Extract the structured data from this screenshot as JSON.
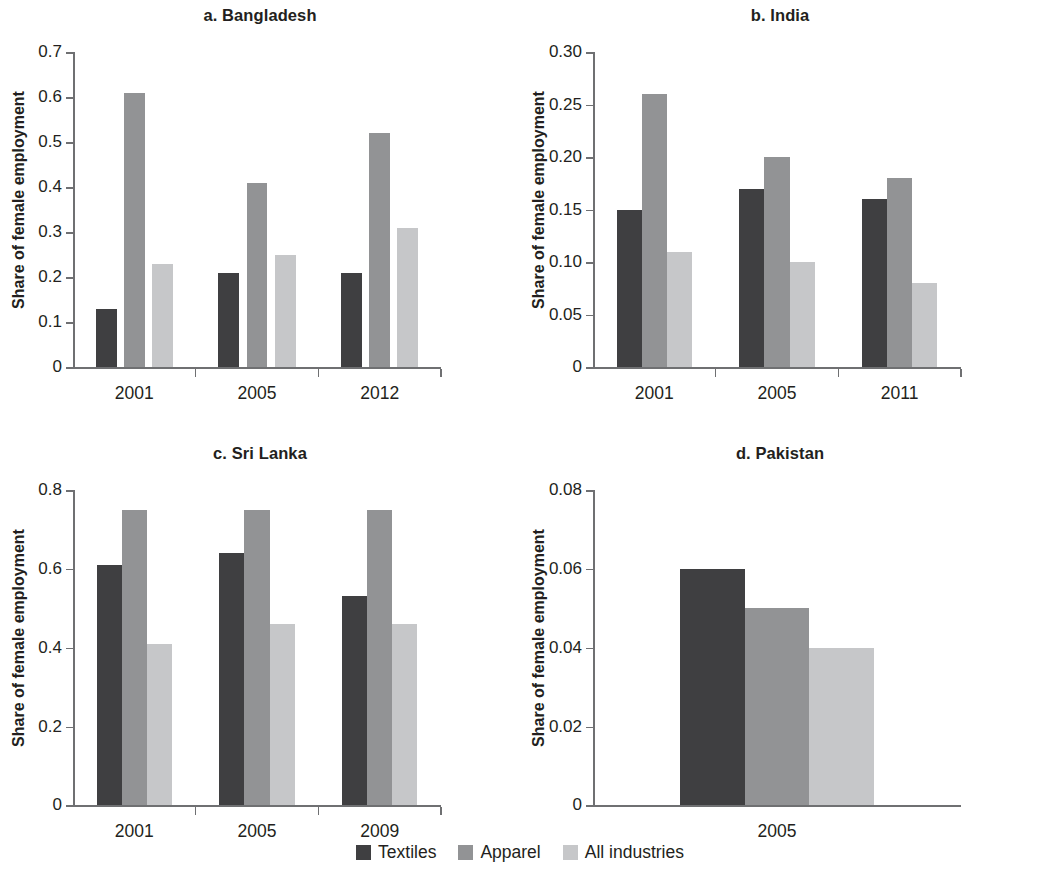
{
  "figure": {
    "ylabel": "Share of female employment"
  },
  "legend": {
    "items": [
      {
        "label": "Textiles",
        "color": "#3f3f41"
      },
      {
        "label": "Apparel",
        "color": "#929395"
      },
      {
        "label": "All industries",
        "color": "#c6c7c9"
      }
    ]
  },
  "chart_data": [
    {
      "type": "bar",
      "panel": "a",
      "title": "a. Bangladesh",
      "xlabel": "",
      "ylabel": "Share of female employment",
      "categories": [
        "2001",
        "2005",
        "2012"
      ],
      "series": [
        {
          "name": "Textiles",
          "color": "#3f3f41",
          "values": [
            0.13,
            0.21,
            0.21
          ]
        },
        {
          "name": "Apparel",
          "color": "#929395",
          "values": [
            0.61,
            0.41,
            0.52
          ]
        },
        {
          "name": "All industries",
          "color": "#c6c7c9",
          "values": [
            0.23,
            0.25,
            0.31
          ]
        }
      ],
      "ylim": [
        0,
        0.7
      ],
      "yticks": [
        0,
        0.1,
        0.2,
        0.3,
        0.4,
        0.5,
        0.6,
        0.7
      ],
      "ytick_labels": [
        "0",
        "0.1",
        "0.2",
        "0.3",
        "0.4",
        "0.5",
        "0.6",
        "0.7"
      ],
      "grid": false,
      "bar_width_frac": 0.17,
      "group_gap_frac": 0.06
    },
    {
      "type": "bar",
      "panel": "b",
      "title": "b. India",
      "xlabel": "",
      "ylabel": "Share of female employment",
      "categories": [
        "2001",
        "2005",
        "2011"
      ],
      "series": [
        {
          "name": "Textiles",
          "color": "#3f3f41",
          "values": [
            0.15,
            0.17,
            0.16
          ]
        },
        {
          "name": "Apparel",
          "color": "#929395",
          "values": [
            0.26,
            0.2,
            0.18
          ]
        },
        {
          "name": "All industries",
          "color": "#c6c7c9",
          "values": [
            0.11,
            0.1,
            0.08
          ]
        }
      ],
      "ylim": [
        0,
        0.3
      ],
      "yticks": [
        0,
        0.05,
        0.1,
        0.15,
        0.2,
        0.25,
        0.3
      ],
      "ytick_labels": [
        "0",
        "0.05",
        "0.10",
        "0.15",
        "0.20",
        "0.25",
        "0.30"
      ],
      "grid": false,
      "bar_width_frac": 0.205,
      "group_gap_frac": 0.0
    },
    {
      "type": "bar",
      "panel": "c",
      "title": "c. Sri Lanka",
      "xlabel": "",
      "ylabel": "Share of female employment",
      "categories": [
        "2001",
        "2005",
        "2009"
      ],
      "series": [
        {
          "name": "Textiles",
          "color": "#3f3f41",
          "values": [
            0.61,
            0.64,
            0.53
          ]
        },
        {
          "name": "Apparel",
          "color": "#929395",
          "values": [
            0.75,
            0.75,
            0.75
          ]
        },
        {
          "name": "All industries",
          "color": "#c6c7c9",
          "values": [
            0.41,
            0.46,
            0.46
          ]
        }
      ],
      "ylim": [
        0,
        0.8
      ],
      "yticks": [
        0,
        0.2,
        0.4,
        0.6,
        0.8
      ],
      "ytick_labels": [
        "0",
        "0.2",
        "0.4",
        "0.6",
        "0.8"
      ],
      "grid": false,
      "bar_width_frac": 0.205,
      "group_gap_frac": 0.0
    },
    {
      "type": "bar",
      "panel": "d",
      "title": "d. Pakistan",
      "xlabel": "",
      "ylabel": "Share of female employment",
      "categories": [
        "2005"
      ],
      "series": [
        {
          "name": "Textiles",
          "color": "#3f3f41",
          "values": [
            0.06
          ]
        },
        {
          "name": "Apparel",
          "color": "#929395",
          "values": [
            0.05
          ]
        },
        {
          "name": "All industries",
          "color": "#c6c7c9",
          "values": [
            0.04
          ]
        }
      ],
      "ylim": [
        0,
        0.08
      ],
      "yticks": [
        0,
        0.02,
        0.04,
        0.06,
        0.08
      ],
      "ytick_labels": [
        "0",
        "0.02",
        "0.04",
        "0.06",
        "0.08"
      ],
      "grid": false,
      "bar_width_frac": 0.175,
      "group_gap_frac": 0.0,
      "hide_x_ticks": true
    }
  ]
}
